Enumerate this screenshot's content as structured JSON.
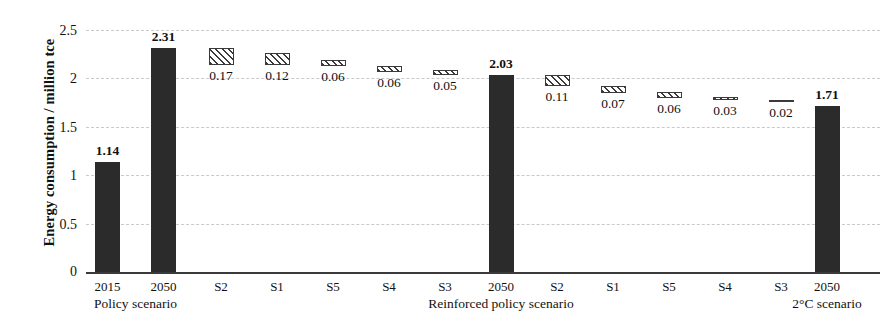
{
  "chart_data": {
    "type": "bar",
    "title": "",
    "xlabel": "",
    "ylabel": "Energy consumption / million tce",
    "ylim": [
      0,
      2.5
    ],
    "yticks": [
      "0",
      "0.5",
      "1",
      "1.5",
      "2",
      "2.5"
    ],
    "grid": true,
    "legend": "none",
    "categories": [
      "2015",
      "2050",
      "S2",
      "S1",
      "S5",
      "S4",
      "S3",
      "2050",
      "S2",
      "S1",
      "S5",
      "S4",
      "S3",
      "2050"
    ],
    "values": [
      1.14,
      2.31,
      0.17,
      0.12,
      0.06,
      0.06,
      0.05,
      2.03,
      0.11,
      0.07,
      0.06,
      0.03,
      0.02,
      1.71
    ],
    "bars": [
      {
        "label": "2015",
        "value": "1.14",
        "v": 1.14,
        "base": 0,
        "top": 1.14,
        "style": "solid",
        "x": 107.5,
        "label_pos": "above"
      },
      {
        "label": "2050",
        "value": "2.31",
        "v": 2.31,
        "base": 0,
        "top": 2.31,
        "style": "solid",
        "x": 163.5,
        "label_pos": "above"
      },
      {
        "label": "S2",
        "value": "0.17",
        "v": 0.17,
        "base": 2.14,
        "top": 2.31,
        "style": "hatched",
        "x": 221.0,
        "label_pos": "below"
      },
      {
        "label": "S1",
        "value": "0.12",
        "v": 0.12,
        "base": 2.14,
        "top": 2.26,
        "style": "hatched",
        "x": 277.0,
        "label_pos": "below"
      },
      {
        "label": "S5",
        "value": "0.06",
        "v": 0.06,
        "base": 2.13,
        "top": 2.19,
        "style": "hatched",
        "x": 333.0,
        "label_pos": "below"
      },
      {
        "label": "S4",
        "value": "0.06",
        "v": 0.06,
        "base": 2.07,
        "top": 2.13,
        "style": "hatched",
        "x": 389.0,
        "label_pos": "below"
      },
      {
        "label": "S3",
        "value": "0.05",
        "v": 0.05,
        "base": 2.04,
        "top": 2.09,
        "style": "hatched",
        "x": 445.0,
        "label_pos": "below"
      },
      {
        "label": "2050",
        "value": "2.03",
        "v": 2.03,
        "base": 0,
        "top": 2.03,
        "style": "solid",
        "x": 501.0,
        "label_pos": "above"
      },
      {
        "label": "S2",
        "value": "0.11",
        "v": 0.11,
        "base": 1.92,
        "top": 2.03,
        "style": "hatched",
        "x": 557.0,
        "label_pos": "below"
      },
      {
        "label": "S1",
        "value": "0.07",
        "v": 0.07,
        "base": 1.85,
        "top": 1.92,
        "style": "hatched",
        "x": 613.0,
        "label_pos": "below"
      },
      {
        "label": "S5",
        "value": "0.06",
        "v": 0.06,
        "base": 1.8,
        "top": 1.86,
        "style": "hatched",
        "x": 669.0,
        "label_pos": "below"
      },
      {
        "label": "S4",
        "value": "0.03",
        "v": 0.03,
        "base": 1.78,
        "top": 1.81,
        "style": "hatched",
        "x": 725.0,
        "label_pos": "below"
      },
      {
        "label": "S3",
        "value": "0.02",
        "v": 0.02,
        "base": 1.76,
        "top": 1.78,
        "style": "flat",
        "x": 781.0,
        "label_pos": "below"
      },
      {
        "label": "2050",
        "value": "1.71",
        "v": 1.71,
        "base": 0,
        "top": 1.71,
        "style": "solid",
        "x": 827.0,
        "label_pos": "above"
      }
    ],
    "group_labels": [
      {
        "text": "Policy scenario",
        "x": 135.5
      },
      {
        "text": "Reinforced policy scenario",
        "x": 501.0
      },
      {
        "text": "2°C scenario",
        "x": 827.0
      }
    ],
    "annotations": [
      "Solid black bars are scenario totals; hatched bars are incremental reductions between scenarios."
    ]
  }
}
